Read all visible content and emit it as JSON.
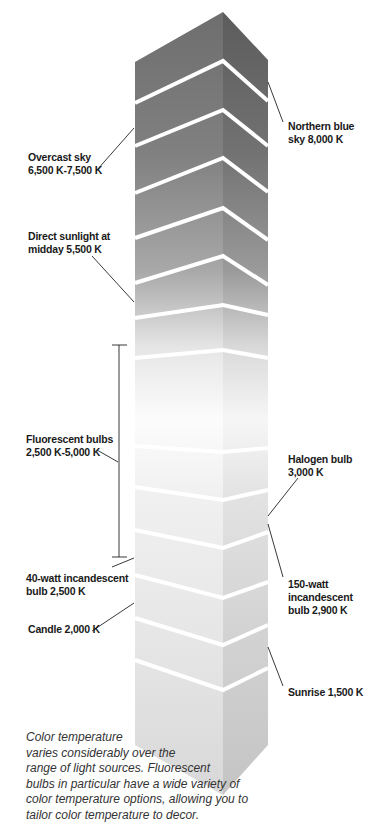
{
  "diagram": {
    "colors": {
      "top_left_face": "#6b6b6b",
      "top_right_face": "#5a5a5a",
      "mid_face": "#fafafa",
      "bottom_left_face": "#dcdcdc",
      "bottom_right_face": "#c8c8c8",
      "band_line": "#ffffff",
      "leader": "#222222"
    },
    "labels": [
      {
        "id": "northern-blue-sky",
        "text": "Northern blue\nsky 8,000 K",
        "side": "right",
        "kelvin": 8000
      },
      {
        "id": "overcast-sky",
        "text": "Overcast sky\n6,500 K-7,500 K",
        "side": "left",
        "kelvin_min": 6500,
        "kelvin_max": 7500
      },
      {
        "id": "direct-sunlight",
        "text": "Direct sunlight at\nmidday 5,500 K",
        "side": "left",
        "kelvin": 5500
      },
      {
        "id": "fluorescent-bulbs",
        "text": "Fluorescent bulbs\n2,500 K-5,000 K",
        "side": "left",
        "kelvin_min": 2500,
        "kelvin_max": 5000
      },
      {
        "id": "halogen-bulb",
        "text": "Halogen bulb\n3,000 K",
        "side": "right",
        "kelvin": 3000
      },
      {
        "id": "incandescent-40w",
        "text": "40-watt incandescent\nbulb 2,500 K",
        "side": "left",
        "kelvin": 2500
      },
      {
        "id": "incandescent-150w",
        "text": "150-watt\nincandescent\nbulb 2,900 K",
        "side": "right",
        "kelvin": 2900
      },
      {
        "id": "candle",
        "text": "Candle 2,000 K",
        "side": "left",
        "kelvin": 2000
      },
      {
        "id": "sunrise",
        "text": "Sunrise 1,500 K",
        "side": "right",
        "kelvin": 1500
      }
    ]
  },
  "caption": {
    "lines": [
      "Color temperature",
      "varies considerably over the",
      "range of light sources. Fluorescent",
      "bulbs in particular have a wide variety of",
      "color temperature options, allowing you to",
      "tailor color temperature to decor."
    ]
  }
}
